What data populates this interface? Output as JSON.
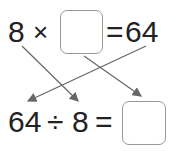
{
  "top_equation": {
    "left": "8",
    "op": "×",
    "eq": "=",
    "result": "64",
    "blank": ""
  },
  "bottom_equation": {
    "left": "64",
    "op": "÷",
    "divisor": "8",
    "eq": "=",
    "blank": ""
  },
  "arrows": [
    {
      "from": "8 (top)",
      "to": "8 (bottom)"
    },
    {
      "from": "64 (top)",
      "to": "64 (bottom)"
    },
    {
      "from": "top blank box",
      "to": "bottom blank box"
    }
  ],
  "colors": {
    "text": "#222222",
    "arrow": "#666666",
    "box_border": "#999999"
  }
}
